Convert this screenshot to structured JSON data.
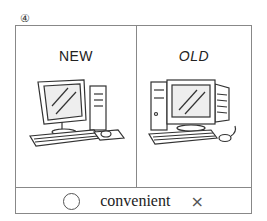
{
  "item_number": "④",
  "panels": [
    {
      "label": "NEW",
      "icon": "flat-monitor-computer-icon"
    },
    {
      "label": "OLD",
      "icon": "crt-monitor-computer-icon"
    }
  ],
  "bottom": {
    "left_symbol": "○",
    "word": "convenient",
    "right_symbol": "×"
  }
}
